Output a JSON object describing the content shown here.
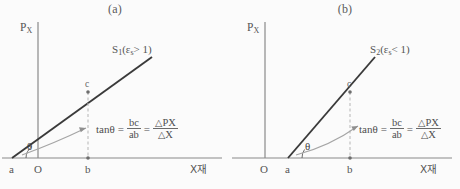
{
  "figure": {
    "background_color": "#fbfbfb",
    "line_color": "#3a3a3a",
    "axis_color": "#8a8a8a",
    "arrow_color": "#9a9a9a",
    "dash_color": "#b0b0b0",
    "text_color": "#4e4e4e"
  },
  "panels": [
    {
      "id": "a",
      "title": "(a)",
      "y_axis_label": "P",
      "y_axis_sub": "X",
      "x_axis_label": "X재",
      "curve_label_main": "S",
      "curve_label_main_sub": "1",
      "curve_label_paren_open": "(",
      "curve_label_eps": "ε",
      "curve_label_eps_sub": "s",
      "curve_label_relation": "> 1",
      "curve_label_paren_close": ")",
      "angle_label": "θ",
      "point_c": "c",
      "tick_a": "a",
      "tick_origin": "O",
      "tick_b": "b",
      "formula": {
        "lhs": "tanθ",
        "eq1": "=",
        "frac1_num": "bc",
        "frac1_den": "ab",
        "eq2": "=",
        "frac2_num_delta": "△",
        "frac2_num": "P",
        "frac2_num_sub": "X",
        "frac2_den_delta": "△",
        "frac2_den": "X"
      },
      "geometry": {
        "x_axis_y": 158,
        "y_axis_x": 38,
        "y_axis_top": 22,
        "x_axis_left": 2,
        "x_axis_right": 222,
        "line_start_x": 12,
        "line_end_x": 152,
        "line_end_y": 57,
        "point_c_x": 88,
        "point_c_y": 92,
        "tick_b_x": 88
      }
    },
    {
      "id": "b",
      "title": "(b)",
      "y_axis_label": "P",
      "y_axis_sub": "X",
      "x_axis_label": "X재",
      "curve_label_main": "S",
      "curve_label_main_sub": "2",
      "curve_label_paren_open": "(",
      "curve_label_eps": "ε",
      "curve_label_eps_sub": "s",
      "curve_label_relation": "< 1",
      "curve_label_paren_close": ")",
      "angle_label": "θ",
      "point_c": "c",
      "tick_a": "a",
      "tick_origin": "O",
      "tick_b": "b",
      "formula": {
        "lhs": "tanθ",
        "eq1": "=",
        "frac1_num": "bc",
        "frac1_den": "ab",
        "eq2": "=",
        "frac2_num_delta": "△",
        "frac2_num": "P",
        "frac2_num_sub": "X",
        "frac2_den_delta": "△",
        "frac2_den": "X"
      },
      "geometry": {
        "x_axis_y": 158,
        "y_axis_x": 35,
        "y_axis_top": 22,
        "x_axis_left": 2,
        "x_axis_right": 222,
        "line_start_x": 58,
        "line_end_x": 145,
        "line_end_y": 57,
        "point_c_x": 120,
        "point_c_y": 92,
        "tick_b_x": 120
      }
    }
  ]
}
